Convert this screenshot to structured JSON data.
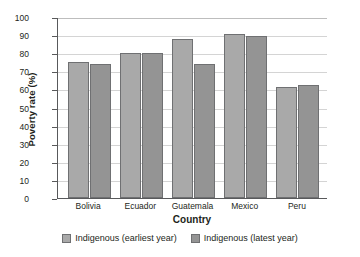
{
  "chart_data": {
    "type": "bar",
    "title": "",
    "xlabel": "Country",
    "ylabel": "Poverty rate (%)",
    "ylim": [
      0,
      100
    ],
    "yticks": [
      0,
      10,
      20,
      30,
      40,
      50,
      60,
      70,
      80,
      90,
      100
    ],
    "grid": true,
    "legend_position": "bottom",
    "categories": [
      "Bolivia",
      "Ecuador",
      "Guatemala",
      "Mexico",
      "Peru"
    ],
    "series": [
      {
        "name": "Indigenous (earliest year)",
        "color": "#a9a9a9",
        "values": [
          75,
          80,
          88,
          90.5,
          61.5
        ]
      },
      {
        "name": "Indigenous (latest year)",
        "color": "#949494",
        "values": [
          74,
          80,
          74,
          89.5,
          62.5
        ]
      }
    ]
  }
}
